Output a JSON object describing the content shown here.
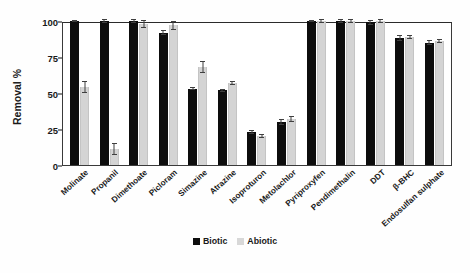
{
  "chart_data": {
    "type": "bar",
    "title": "",
    "xlabel": "",
    "ylabel": "Removal %",
    "ylim": [
      0,
      100
    ],
    "yticks": [
      0,
      25,
      50,
      75,
      100
    ],
    "grid": false,
    "legend_position": "bottom-center",
    "categories": [
      "Molinate",
      "Propanil",
      "Dimethoate",
      "Picloram",
      "Simazine",
      "Atrazine",
      "Isoproturon",
      "Metolachlor",
      "Pyriproxyfen",
      "Pendimethalin",
      "DDT",
      "β-BHC",
      "Endosulfan sulphate"
    ],
    "series": [
      {
        "name": "Biotic",
        "color": "#0d0d0d",
        "values": [
          100,
          100,
          100,
          92,
          53,
          52,
          23,
          30,
          100,
          100,
          99,
          88,
          85
        ],
        "errors": [
          1,
          1.5,
          1.5,
          2,
          1,
          1,
          1.5,
          2,
          1,
          1.5,
          1.5,
          2,
          1.5
        ]
      },
      {
        "name": "Abiotic",
        "color": "#d4d4d4",
        "values": [
          54,
          11,
          98,
          97,
          68,
          57,
          20,
          32,
          100,
          100,
          100,
          89,
          86
        ],
        "errors": [
          4,
          4,
          3,
          3,
          4,
          1.5,
          1.5,
          2,
          1.5,
          1.5,
          1.5,
          1.5,
          1.5
        ]
      }
    ]
  },
  "legend": {
    "items": [
      {
        "label": "Biotic",
        "color": "#0d0d0d"
      },
      {
        "label": "Abiotic",
        "color": "#d8d8d8"
      }
    ]
  }
}
